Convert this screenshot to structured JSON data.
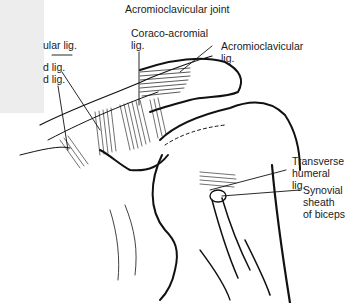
{
  "diagram": {
    "labels": {
      "top": "Acromioclavicular joint",
      "coraco_acromial_line1": "Coraco-acromial",
      "coraco_acromial_line2": "lig.",
      "acromioclavicular_lig_line1": "Acromioclavicular",
      "acromioclavicular_lig_line2": "lig.",
      "left_truncated_1": "ular  lig.",
      "left_truncated_2": "d lig.",
      "left_truncated_3": "d lig.",
      "transverse_line1": "Transverse",
      "transverse_line2": "humeral",
      "transverse_line3": "lig.",
      "synovial_line1": "Synovial",
      "synovial_line2": "sheath",
      "synovial_line3": "of biceps"
    },
    "colors": {
      "ink": "#111111",
      "background": "#ffffff",
      "left_overlay": "#ededed"
    }
  }
}
